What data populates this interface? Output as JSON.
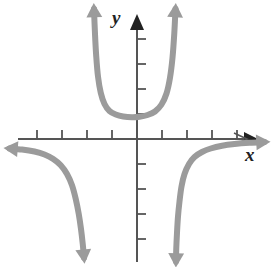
{
  "figure": {
    "name": "coordinate-plane-graph",
    "width": 272,
    "height": 267,
    "background_color": "#ffffff"
  },
  "axes": {
    "x_label": "x",
    "y_label": "y",
    "axis_color": "#555555",
    "origin_px": [
      137,
      139
    ],
    "unit_px": 25,
    "x_ticks_left": 4,
    "x_ticks_right": 4,
    "y_ticks_up": 4,
    "y_ticks_down": 4,
    "tick_length_px": 9,
    "x_axis_arrow": "right",
    "y_axis_arrow": "up"
  },
  "chart_data": {
    "type": "line",
    "title": "",
    "xlabel": "x",
    "ylabel": "y",
    "grid": false,
    "legend": "none",
    "curve_color": "#9b9b9b",
    "curve_width": 6,
    "xlim": [
      -5.5,
      5.4
    ],
    "ylim": [
      -5.1,
      5.5
    ],
    "xticks": [
      -4,
      -3,
      -2,
      -1,
      1,
      2,
      3,
      4
    ],
    "yticks": [
      -4,
      -3,
      -2,
      -1,
      1,
      2,
      3,
      4
    ],
    "series": [
      {
        "name": "upper-u-branch",
        "arrows": [
          "up-left",
          "up-right"
        ],
        "points": [
          [
            -1.72,
            5.2
          ],
          [
            -1.68,
            4.2
          ],
          [
            -1.63,
            3.3
          ],
          [
            -1.56,
            2.5
          ],
          [
            -1.45,
            1.85
          ],
          [
            -1.3,
            1.4
          ],
          [
            -1.1,
            1.12
          ],
          [
            -0.85,
            0.98
          ],
          [
            -0.55,
            0.9
          ],
          [
            -0.2,
            0.87
          ],
          [
            0.1,
            0.89
          ],
          [
            0.42,
            0.96
          ],
          [
            0.72,
            1.1
          ],
          [
            0.98,
            1.38
          ],
          [
            1.18,
            1.82
          ],
          [
            1.32,
            2.45
          ],
          [
            1.42,
            3.25
          ],
          [
            1.49,
            4.2
          ],
          [
            1.54,
            5.2
          ]
        ]
      },
      {
        "name": "left-lower-branch",
        "arrows": [
          "left",
          "down"
        ],
        "points": [
          [
            -5.1,
            -0.38
          ],
          [
            -4.6,
            -0.42
          ],
          [
            -4.1,
            -0.5
          ],
          [
            -3.7,
            -0.62
          ],
          [
            -3.35,
            -0.8
          ],
          [
            -3.05,
            -1.05
          ],
          [
            -2.8,
            -1.4
          ],
          [
            -2.6,
            -1.85
          ],
          [
            -2.45,
            -2.4
          ],
          [
            -2.33,
            -3.0
          ],
          [
            -2.24,
            -3.6
          ],
          [
            -2.17,
            -4.2
          ],
          [
            -2.12,
            -4.75
          ]
        ]
      },
      {
        "name": "right-lower-branch",
        "arrows": [
          "right",
          "down"
        ],
        "points": [
          [
            5.1,
            -0.12
          ],
          [
            4.5,
            -0.15
          ],
          [
            3.9,
            -0.2
          ],
          [
            3.4,
            -0.27
          ],
          [
            2.95,
            -0.38
          ],
          [
            2.6,
            -0.52
          ],
          [
            2.3,
            -0.72
          ],
          [
            2.08,
            -1.0
          ],
          [
            1.9,
            -1.4
          ],
          [
            1.78,
            -1.9
          ],
          [
            1.7,
            -2.5
          ],
          [
            1.64,
            -3.1
          ],
          [
            1.6,
            -3.75
          ],
          [
            1.57,
            -4.4
          ],
          [
            1.56,
            -4.9
          ]
        ]
      }
    ]
  }
}
